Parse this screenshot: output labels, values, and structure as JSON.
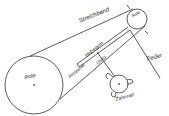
{
  "diagram": {
    "labels": {
      "streichband": "Streichband",
      "rolle_small": "Rolle",
      "hebelarm": "Hebelarm",
      "feder": "Feder",
      "rolle_large": "Rolle",
      "festpunkt": "Festpunkt",
      "uebertragung": "Übrtg.",
      "zahnrad": "Zahnrad"
    },
    "colors": {
      "line": "#333333",
      "background": "#ffffff"
    }
  }
}
